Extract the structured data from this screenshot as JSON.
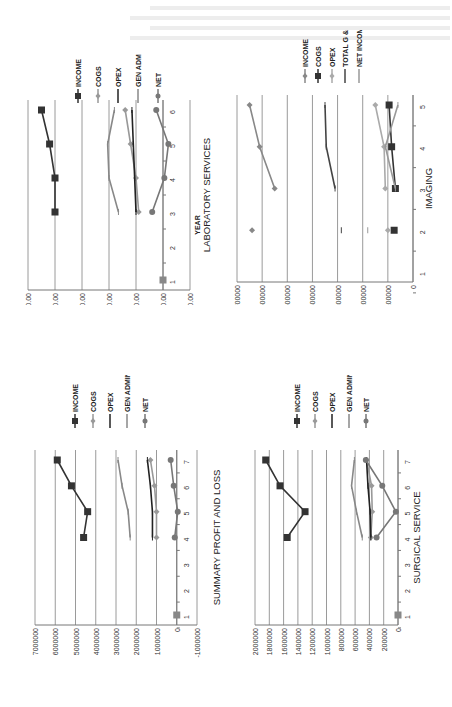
{
  "page": {
    "orientation": "rotated-90-ccw",
    "background": "#ffffff"
  },
  "chart_data": [
    {
      "id": "lab",
      "type": "line",
      "title": "LABORATORY SERVICES",
      "xlabel": "YEAR",
      "ylabel": "",
      "x": [
        1,
        2,
        3,
        4,
        5,
        6
      ],
      "ylim": [
        -100000,
        500000
      ],
      "yticks": [
        "$500,000.00",
        "$400,000.00",
        "$300,000.00",
        "$200,000.00",
        "$100,000.00",
        "$0.00",
        "-$100,000.00"
      ],
      "ytick_values": [
        500000,
        400000,
        300000,
        200000,
        100000,
        0,
        -100000
      ],
      "grid": true,
      "legend_position": "right",
      "series": [
        {
          "name": "INCOME",
          "marker": "square",
          "color": "#333333",
          "values": [
            0,
            null,
            400000,
            400000,
            420000,
            450000
          ]
        },
        {
          "name": "COGS",
          "marker": "diamond",
          "color": "#999999",
          "values": [
            null,
            null,
            90000,
            100000,
            120000,
            140000
          ]
        },
        {
          "name": "OPEX",
          "marker": "dash",
          "color": "#222222",
          "values": [
            null,
            null,
            100000,
            105000,
            110000,
            115000
          ]
        },
        {
          "name": "GEN ADM",
          "marker": "dash",
          "color": "#888888",
          "values": [
            null,
            null,
            165000,
            200000,
            205000,
            180000
          ]
        },
        {
          "name": "NET",
          "marker": "circle",
          "color": "#777777",
          "values": [
            null,
            null,
            40000,
            -5000,
            -20000,
            25000
          ]
        }
      ]
    },
    {
      "id": "imaging",
      "type": "line",
      "title": "IMAGING",
      "xlabel": "",
      "ylabel": "",
      "x": [
        1,
        2,
        3,
        4,
        5
      ],
      "ylim": [
        0,
        700000
      ],
      "yticks": [
        "700000",
        "600000",
        "500000",
        "400000",
        "300000",
        "200000",
        "100000",
        "0"
      ],
      "ytick_values": [
        700000,
        600000,
        500000,
        400000,
        300000,
        200000,
        100000,
        0
      ],
      "grid": true,
      "legend_position": "right",
      "series": [
        {
          "name": "INCOME",
          "marker": "diamond",
          "color": "#888888",
          "values": [
            null,
            640000,
            550000,
            610000,
            650000
          ]
        },
        {
          "name": "COGS",
          "marker": "square",
          "color": "#333333",
          "values": [
            null,
            75000,
            70000,
            85000,
            95000
          ]
        },
        {
          "name": "OPEX",
          "marker": "diamond",
          "color": "#aaaaaa",
          "values": [
            null,
            100000,
            110000,
            115000,
            150000
          ]
        },
        {
          "name": "TOTAL G & A",
          "marker": "dash",
          "color": "#444444",
          "values": [
            null,
            285000,
            310000,
            345000,
            350000
          ]
        },
        {
          "name": "NET INCOME",
          "marker": "dash",
          "color": "#999999",
          "values": [
            null,
            180000,
            70000,
            110000,
            60000
          ]
        }
      ]
    },
    {
      "id": "summary",
      "type": "line",
      "title": "SUMMARY PROFIT AND LOSS",
      "xlabel": "",
      "ylabel": "",
      "x": [
        1,
        2,
        3,
        4,
        5,
        6,
        7
      ],
      "ylim": [
        -1000000,
        7000000
      ],
      "yticks": [
        "7000000",
        "6000000",
        "5000000",
        "4000000",
        "3000000",
        "2000000",
        "1000000",
        "0",
        "-1000000"
      ],
      "ytick_values": [
        7000000,
        6000000,
        5000000,
        4000000,
        3000000,
        2000000,
        1000000,
        0,
        -1000000
      ],
      "grid": true,
      "legend_position": "right",
      "series": [
        {
          "name": "INCOME",
          "marker": "square",
          "color": "#333333",
          "values": [
            0,
            null,
            null,
            4600000,
            4400000,
            5200000,
            5900000
          ]
        },
        {
          "name": "COGS",
          "marker": "diamond",
          "color": "#999999",
          "values": [
            null,
            null,
            null,
            1000000,
            1000000,
            1100000,
            1300000
          ]
        },
        {
          "name": "OPEX",
          "marker": "dash",
          "color": "#222222",
          "values": [
            null,
            null,
            null,
            1200000,
            1200000,
            1300000,
            1450000
          ]
        },
        {
          "name": "GEN ADMIN",
          "marker": "dash",
          "color": "#888888",
          "values": [
            null,
            null,
            null,
            2300000,
            2400000,
            2700000,
            2900000
          ]
        },
        {
          "name": "NET",
          "marker": "circle",
          "color": "#777777",
          "values": [
            null,
            null,
            null,
            100000,
            -50000,
            150000,
            300000
          ]
        }
      ]
    },
    {
      "id": "surgical",
      "type": "line",
      "title": "SURGICAL SERVICE",
      "xlabel": "",
      "ylabel": "",
      "x": [
        1,
        2,
        3,
        4,
        5,
        6,
        7
      ],
      "ylim": [
        0,
        2000000
      ],
      "yticks": [
        "2000000",
        "1800000",
        "1600000",
        "1400000",
        "1200000",
        "1000000",
        "800000",
        "600000",
        "400000",
        "200000",
        "0"
      ],
      "ytick_values": [
        2000000,
        1800000,
        1600000,
        1400000,
        1200000,
        1000000,
        800000,
        600000,
        400000,
        200000,
        0
      ],
      "grid": true,
      "legend_position": "right",
      "series": [
        {
          "name": "INCOME",
          "marker": "square",
          "color": "#333333",
          "values": [
            0,
            null,
            null,
            1550000,
            1300000,
            1650000,
            1850000
          ]
        },
        {
          "name": "COGS",
          "marker": "diamond",
          "color": "#999999",
          "values": [
            null,
            null,
            null,
            380000,
            360000,
            370000,
            440000
          ]
        },
        {
          "name": "OPEX",
          "marker": "dash",
          "color": "#222222",
          "values": [
            null,
            null,
            null,
            380000,
            390000,
            420000,
            440000
          ]
        },
        {
          "name": "GEN ADMIN",
          "marker": "dash",
          "color": "#888888",
          "values": [
            null,
            null,
            null,
            500000,
            580000,
            650000,
            610000
          ]
        },
        {
          "name": "NET",
          "marker": "circle",
          "color": "#777777",
          "values": [
            null,
            null,
            null,
            300000,
            30000,
            220000,
            450000
          ]
        }
      ]
    }
  ]
}
